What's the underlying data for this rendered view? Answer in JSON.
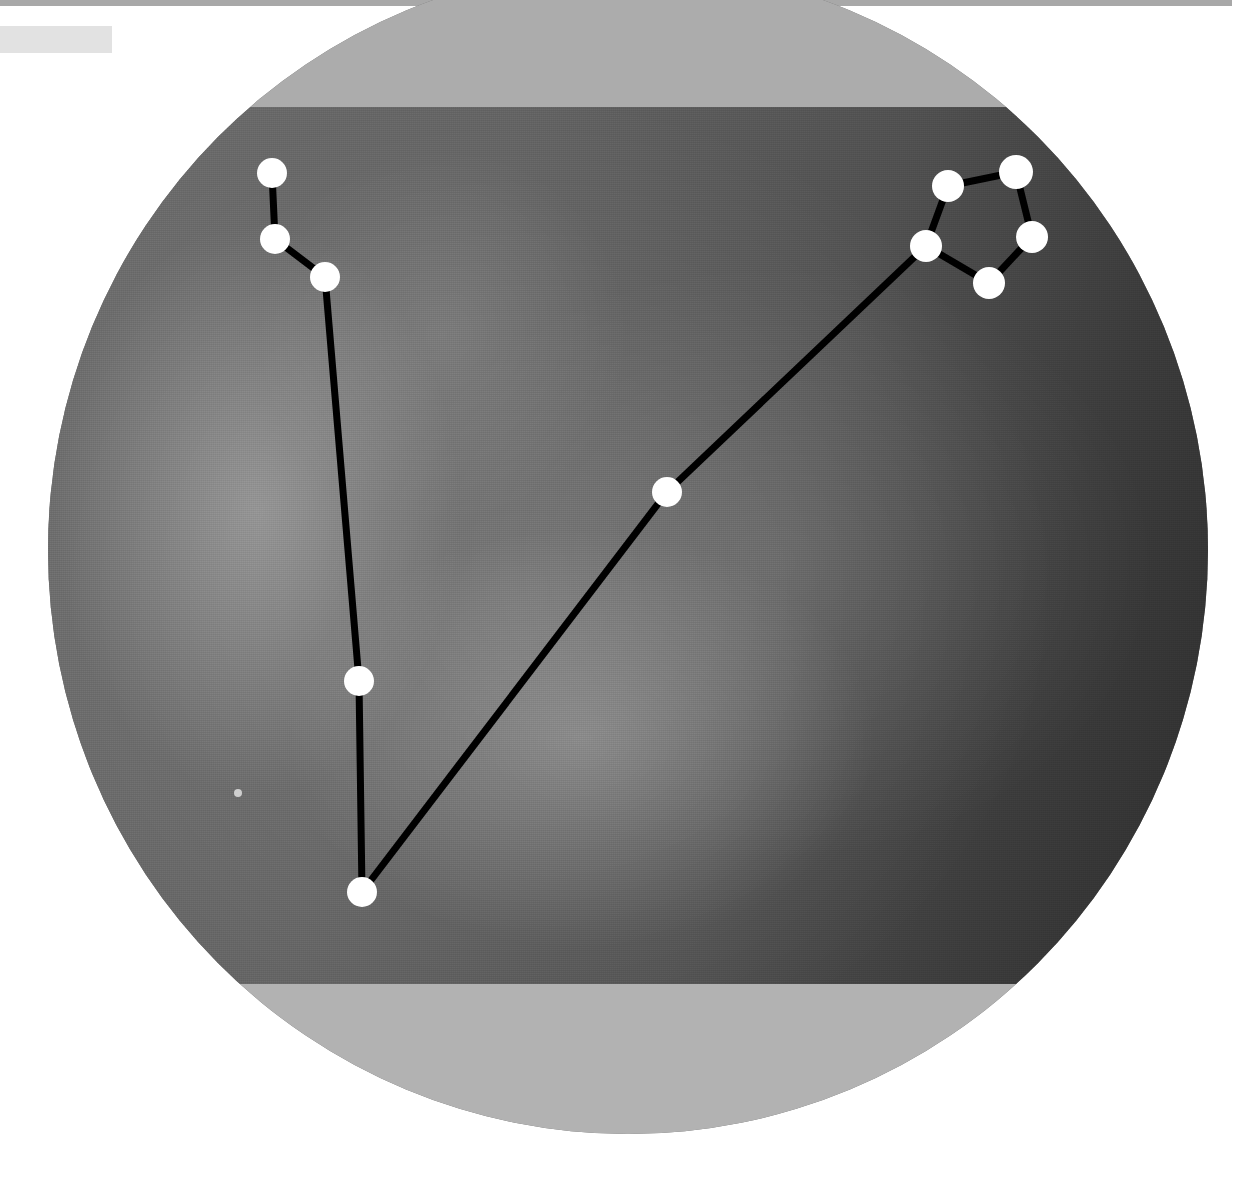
{
  "window": {
    "title": "Sky Map",
    "top_bar_color": "#a8a8a8",
    "background_color": "#ffffff"
  },
  "title_block": {
    "label": "",
    "color": "#e2e2e2"
  },
  "sky_view": {
    "shape": "ellipse",
    "center_x": 628,
    "center_y": 550,
    "radius_x": 580,
    "radius_y": 584,
    "band_color": "#acacac",
    "sky_color_bright": "#6e6e6e",
    "sky_color_dark": "#2e2e2e",
    "line_color": "#000000",
    "star_color": "#ffffff"
  },
  "chart_data": {
    "type": "scatter",
    "xlabel": "",
    "ylabel": "",
    "xlim": [
      0,
      1160
    ],
    "ylim": [
      0,
      1168
    ],
    "grid": false,
    "legend": "none",
    "stars": [
      {
        "id": "s1",
        "label": "upper-handle-tip",
        "x": 224,
        "y": 207,
        "r": 15
      },
      {
        "id": "s2",
        "label": "upper-handle-mid",
        "x": 227,
        "y": 273,
        "r": 15
      },
      {
        "id": "s3",
        "label": "upper-handle-bend",
        "x": 277,
        "y": 311,
        "r": 15
      },
      {
        "id": "s4",
        "label": "lower-stem",
        "x": 311,
        "y": 715,
        "r": 15
      },
      {
        "id": "s5",
        "label": "vertex-bottom",
        "x": 314,
        "y": 926,
        "r": 15
      },
      {
        "id": "s6",
        "label": "mid-ray",
        "x": 619,
        "y": 526,
        "r": 15
      },
      {
        "id": "s7",
        "label": "ring-left",
        "x": 878,
        "y": 280,
        "r": 16
      },
      {
        "id": "s8",
        "label": "ring-upper-left",
        "x": 900,
        "y": 220,
        "r": 16
      },
      {
        "id": "s9",
        "label": "ring-top",
        "x": 968,
        "y": 206,
        "r": 17
      },
      {
        "id": "s10",
        "label": "ring-right",
        "x": 984,
        "y": 271,
        "r": 16
      },
      {
        "id": "s11",
        "label": "ring-bottom",
        "x": 941,
        "y": 317,
        "r": 16
      },
      {
        "id": "s12",
        "label": "faint-field-star",
        "x": 190,
        "y": 827,
        "r": 4
      }
    ],
    "lines": [
      {
        "from": "s1",
        "to": "s2"
      },
      {
        "from": "s2",
        "to": "s3"
      },
      {
        "from": "s3",
        "to": "s4"
      },
      {
        "from": "s4",
        "to": "s5"
      },
      {
        "from": "s5",
        "to": "s6"
      },
      {
        "from": "s6",
        "to": "s7"
      },
      {
        "from": "s7",
        "to": "s8"
      },
      {
        "from": "s8",
        "to": "s9"
      },
      {
        "from": "s9",
        "to": "s10"
      },
      {
        "from": "s10",
        "to": "s11"
      },
      {
        "from": "s11",
        "to": "s7"
      }
    ]
  }
}
